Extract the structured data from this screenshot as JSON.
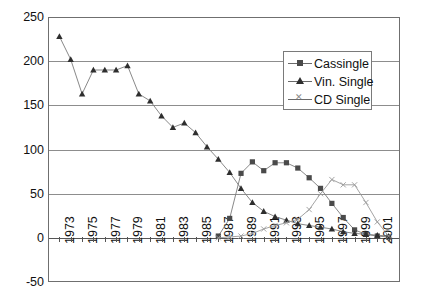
{
  "chart_data": {
    "type": "line",
    "title": "",
    "xlabel": "",
    "ylabel": "",
    "ylim": [
      -50,
      250
    ],
    "yticks": [
      -50,
      0,
      50,
      100,
      150,
      200,
      250
    ],
    "grid": true,
    "legend_position": "top-right-inside",
    "x": [
      1973,
      1974,
      1975,
      1976,
      1977,
      1978,
      1979,
      1980,
      1981,
      1982,
      1983,
      1984,
      1985,
      1986,
      1987,
      1988,
      1989,
      1990,
      1991,
      1992,
      1993,
      1994,
      1995,
      1996,
      1997,
      1998,
      1999,
      2000,
      2001,
      2002
    ],
    "xtick_labels": [
      "1973",
      "",
      "1975",
      "",
      "1977",
      "",
      "1979",
      "",
      "1981",
      "",
      "1983",
      "",
      "1985",
      "",
      "1987",
      "",
      "1989",
      "",
      "1991",
      "",
      "1993",
      "",
      "1995",
      "",
      "1997",
      "",
      "1999",
      "",
      "2001",
      ""
    ],
    "series": [
      {
        "name": "Cassingle",
        "marker": "square",
        "values": [
          null,
          null,
          null,
          null,
          null,
          null,
          null,
          null,
          null,
          null,
          null,
          null,
          null,
          null,
          2,
          22,
          73,
          86,
          76,
          85,
          85,
          79,
          68,
          56,
          39,
          23,
          9,
          4,
          2,
          1
        ]
      },
      {
        "name": "Vin. Single",
        "marker": "triangle",
        "values": [
          228,
          202,
          163,
          190,
          190,
          190,
          195,
          163,
          155,
          138,
          125,
          130,
          119,
          103,
          89,
          74,
          56,
          40,
          30,
          24,
          20,
          16,
          14,
          12,
          10,
          7,
          5,
          4,
          3,
          2
        ]
      },
      {
        "name": "CD Single",
        "marker": "x",
        "values": [
          null,
          null,
          null,
          null,
          null,
          null,
          null,
          null,
          null,
          null,
          null,
          null,
          null,
          null,
          0,
          1,
          2,
          5,
          10,
          14,
          17,
          21,
          32,
          50,
          66,
          60,
          60,
          40,
          18,
          2
        ]
      }
    ]
  },
  "legend": {
    "items": [
      {
        "label": "Cassingle",
        "marker": "square"
      },
      {
        "label": "Vin. Single",
        "marker": "triangle"
      },
      {
        "label": "CD Single",
        "marker": "x"
      }
    ]
  },
  "colors": {
    "axis": "#6f6f6f",
    "grid": "#8d8d8d",
    "cassingle": "#4a4a4a",
    "vin_single": "#2e2e2e",
    "cd_single": "#9a9a9a",
    "line": "#7a7a7a",
    "background": "#ffffff"
  }
}
